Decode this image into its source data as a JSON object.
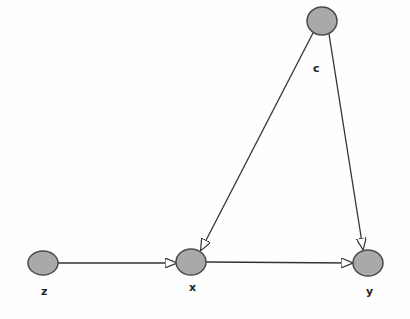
{
  "diagram": {
    "type": "directed-graph",
    "colors": {
      "node_fill": "#a9a9a9",
      "node_stroke": "#4a4a4a",
      "edge": "#333333",
      "arrowhead_fill": "#ffffff",
      "background": "#fefefe"
    },
    "nodes": [
      {
        "id": "c",
        "label": "c",
        "cx": 322,
        "cy": 21,
        "rx": 15,
        "ry": 14,
        "label_x": 313,
        "label_y": 72
      },
      {
        "id": "z",
        "label": "z",
        "cx": 43,
        "cy": 263,
        "rx": 15,
        "ry": 12,
        "label_x": 41,
        "label_y": 295
      },
      {
        "id": "x",
        "label": "x",
        "cx": 191,
        "cy": 262,
        "rx": 15,
        "ry": 13,
        "label_x": 189,
        "label_y": 291
      },
      {
        "id": "y",
        "label": "y",
        "cx": 368,
        "cy": 263,
        "rx": 15,
        "ry": 13,
        "label_x": 366,
        "label_y": 295
      }
    ],
    "edges": [
      {
        "from": "c",
        "to": "x",
        "x1": 313,
        "y1": 33,
        "x2": 201,
        "y2": 250
      },
      {
        "from": "c",
        "to": "y",
        "x1": 329,
        "y1": 34,
        "x2": 363,
        "y2": 249
      },
      {
        "from": "z",
        "to": "x",
        "x1": 58,
        "y1": 263,
        "x2": 176,
        "y2": 263
      },
      {
        "from": "x",
        "to": "y",
        "x1": 206,
        "y1": 262,
        "x2": 352,
        "y2": 263
      }
    ]
  }
}
